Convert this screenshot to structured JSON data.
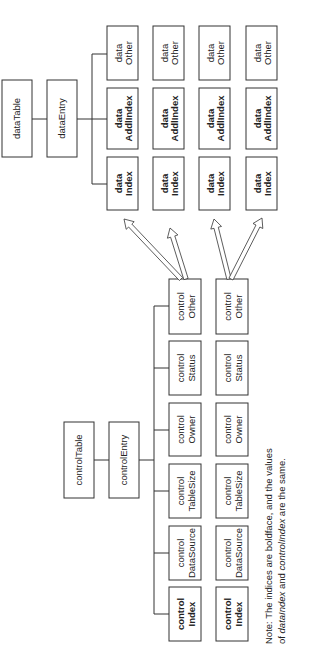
{
  "diagram": {
    "orientation": "rotated-90-ccw",
    "data_side": {
      "table": {
        "label": "dataTable"
      },
      "entry": {
        "label": "dataEntry"
      },
      "columns": [
        {
          "line1": "data",
          "line2": "Index",
          "bold": true
        },
        {
          "line1": "data",
          "line2": "AddlIndex",
          "bold": true
        },
        {
          "line1": "data",
          "line2": "Other",
          "bold": false
        }
      ],
      "rows": 4
    },
    "control_side": {
      "table": {
        "label": "controlTable"
      },
      "entry": {
        "label": "controlEntry"
      },
      "columns": [
        {
          "line1": "control",
          "line2": "Index",
          "bold": true
        },
        {
          "line1": "control",
          "line2": "DataSource",
          "bold": false
        },
        {
          "line1": "control",
          "line2": "TableSize",
          "bold": false
        },
        {
          "line1": "control",
          "line2": "Owner",
          "bold": false
        },
        {
          "line1": "control",
          "line2": "Status",
          "bold": false
        },
        {
          "line1": "control",
          "line2": "Other",
          "bold": false
        }
      ],
      "rows": 2
    },
    "arrows": [
      {
        "from": "controlOther row 1",
        "to": "dataIndex row 1"
      },
      {
        "from": "controlOther row 1",
        "to": "dataIndex row 2"
      },
      {
        "from": "controlOther row 2",
        "to": "dataIndex row 3"
      },
      {
        "from": "controlOther row 2",
        "to": "dataIndex row 4"
      }
    ],
    "note": {
      "line1": "Note: The indices are boldface, and the values",
      "line2_prefix": "of ",
      "line2_italic1": "dataIndex",
      "line2_mid": " and ",
      "line2_italic2": "controlIndex",
      "line2_suffix": " are the same."
    },
    "colors": {
      "stroke": "#333333",
      "text": "#222222",
      "background": "#ffffff"
    }
  }
}
